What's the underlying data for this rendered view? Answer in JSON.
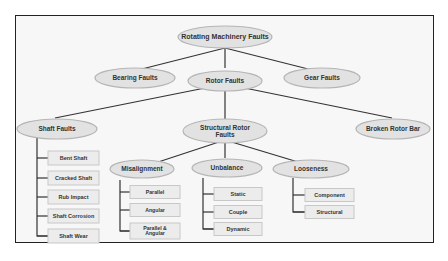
{
  "diagram": {
    "root": "Rotating Machinery Faults",
    "level1": [
      "Bearing Faults",
      "Rotor Faults",
      "Gear Faults"
    ],
    "rotor_children": [
      "Shaft Faults",
      "Structural Rotor Faults",
      "Broken Rotor Bar"
    ],
    "shaft_faults": [
      "Bent Shaft",
      "Cracked Shaft",
      "Rub Impact",
      "Shaft Corrosion",
      "Shaft Wear"
    ],
    "structural_children": [
      "Misalignment",
      "Unbalance",
      "Looseness"
    ],
    "misalignment": [
      "Parallel",
      "Angular",
      "Parallel & Angular"
    ],
    "unbalance": [
      "Static",
      "Couple",
      "Dynamic"
    ],
    "looseness": [
      "Component",
      "Structural"
    ]
  },
  "colors": {
    "ellipse_fill": "#e2e2e2",
    "ellipse_stroke": "#b5b5b5",
    "box_fill": "#ececec",
    "box_stroke": "#c8c8c8",
    "line": "#333333"
  }
}
